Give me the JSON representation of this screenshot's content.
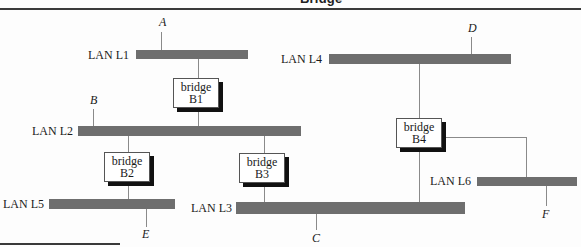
{
  "header": {
    "title_fragment": "Bridge"
  },
  "colors": {
    "lan_bar": "#6e6e6e",
    "connector": "#8a8a8a",
    "bridge_shadow": "#111111",
    "rule": "#3a3a3a"
  },
  "lans": [
    {
      "id": "L1",
      "label": "LAN L1"
    },
    {
      "id": "L2",
      "label": "LAN L2"
    },
    {
      "id": "L3",
      "label": "LAN L3"
    },
    {
      "id": "L4",
      "label": "LAN L4"
    },
    {
      "id": "L5",
      "label": "LAN L5"
    },
    {
      "id": "L6",
      "label": "LAN L6"
    }
  ],
  "bridges": [
    {
      "id": "B1",
      "word": "bridge",
      "name": "B1",
      "connects": [
        "L1",
        "L2"
      ]
    },
    {
      "id": "B2",
      "word": "bridge",
      "name": "B2",
      "connects": [
        "L2",
        "L5"
      ]
    },
    {
      "id": "B3",
      "word": "bridge",
      "name": "B3",
      "connects": [
        "L2",
        "L3"
      ]
    },
    {
      "id": "B4",
      "word": "bridge",
      "name": "B4",
      "connects": [
        "L4",
        "L3",
        "L6"
      ]
    }
  ],
  "stations": [
    {
      "id": "A",
      "label": "A",
      "lan": "L1"
    },
    {
      "id": "B",
      "label": "B",
      "lan": "L2"
    },
    {
      "id": "C",
      "label": "C",
      "lan": "L3"
    },
    {
      "id": "D",
      "label": "D",
      "lan": "L4"
    },
    {
      "id": "E",
      "label": "E",
      "lan": "L5"
    },
    {
      "id": "F",
      "label": "F",
      "lan": "L6"
    }
  ]
}
